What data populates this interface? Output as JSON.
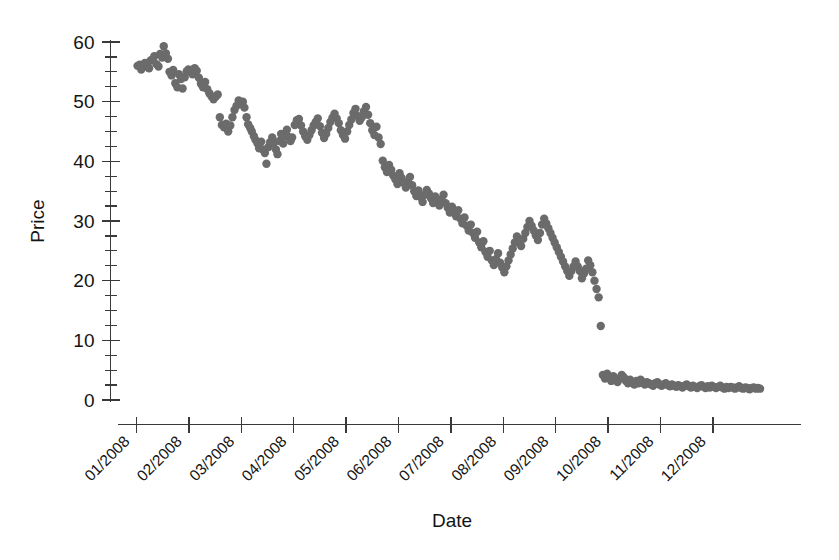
{
  "chart_data": {
    "type": "scatter",
    "title": "",
    "xlabel": "Date",
    "ylabel": "Price",
    "grid": false,
    "legend": null,
    "point_color": "#6b6b6b",
    "axis_color": "#3a3a3a",
    "background": "#ffffff",
    "ylim": [
      0,
      60
    ],
    "y_major_ticks": [
      0,
      10,
      20,
      30,
      40,
      50,
      60
    ],
    "y_major_labels": [
      "0",
      "10",
      "20",
      "30",
      "40",
      "50",
      "60"
    ],
    "y_minor_interval": 2.5,
    "xlim": [
      0,
      13
    ],
    "x_tick_labels": [
      "01/2008",
      "02/2008",
      "03/2008",
      "04/2008",
      "05/2008",
      "06/2008",
      "07/2008",
      "08/2008",
      "09/2008",
      "10/2008",
      "11/2008",
      "12/2008"
    ],
    "x_tick_positions": [
      1,
      2,
      3,
      4,
      5,
      6,
      7,
      8,
      9,
      10,
      11,
      12
    ],
    "x_tick_rotation_deg": -45,
    "x_unit": "month-index",
    "series": [
      {
        "name": "Price",
        "marker": "circle",
        "marker_radius_px": 4.2,
        "x": [
          1.02,
          1.06,
          1.09,
          1.13,
          1.16,
          1.2,
          1.24,
          1.27,
          1.31,
          1.34,
          1.38,
          1.42,
          1.45,
          1.49,
          1.52,
          1.56,
          1.6,
          1.63,
          1.67,
          1.7,
          1.74,
          1.78,
          1.81,
          1.85,
          1.88,
          1.92,
          1.96,
          1.99,
          2.03,
          2.07,
          2.11,
          2.15,
          2.19,
          2.23,
          2.27,
          2.31,
          2.35,
          2.39,
          2.43,
          2.47,
          2.51,
          2.55,
          2.59,
          2.63,
          2.67,
          2.71,
          2.75,
          2.79,
          2.83,
          2.87,
          2.91,
          2.95,
          2.99,
          3.03,
          3.06,
          3.1,
          3.13,
          3.17,
          3.2,
          3.24,
          3.27,
          3.31,
          3.34,
          3.38,
          3.41,
          3.45,
          3.48,
          3.52,
          3.55,
          3.59,
          3.62,
          3.66,
          3.69,
          3.73,
          3.76,
          3.8,
          3.83,
          3.87,
          3.9,
          3.94,
          3.97,
          4.02,
          4.06,
          4.1,
          4.14,
          4.18,
          4.22,
          4.26,
          4.3,
          4.34,
          4.38,
          4.42,
          4.46,
          4.5,
          4.54,
          4.58,
          4.62,
          4.66,
          4.7,
          4.74,
          4.78,
          4.82,
          4.86,
          4.9,
          4.94,
          4.98,
          5.02,
          5.06,
          5.1,
          5.14,
          5.18,
          5.22,
          5.26,
          5.3,
          5.34,
          5.38,
          5.42,
          5.46,
          5.5,
          5.54,
          5.58,
          5.62,
          5.66,
          5.7,
          5.74,
          5.78,
          5.82,
          5.86,
          5.9,
          5.94,
          5.98,
          6.02,
          6.06,
          6.1,
          6.14,
          6.18,
          6.22,
          6.26,
          6.3,
          6.34,
          6.38,
          6.42,
          6.46,
          6.5,
          6.54,
          6.58,
          6.62,
          6.66,
          6.7,
          6.74,
          6.78,
          6.82,
          6.86,
          6.9,
          6.94,
          6.98,
          7.02,
          7.06,
          7.1,
          7.14,
          7.18,
          7.22,
          7.26,
          7.3,
          7.34,
          7.38,
          7.42,
          7.46,
          7.5,
          7.54,
          7.58,
          7.62,
          7.66,
          7.7,
          7.74,
          7.78,
          7.82,
          7.86,
          7.9,
          7.94,
          7.98,
          8.02,
          8.06,
          8.1,
          8.14,
          8.18,
          8.22,
          8.26,
          8.3,
          8.34,
          8.38,
          8.42,
          8.46,
          8.5,
          8.54,
          8.58,
          8.62,
          8.66,
          8.7,
          8.74,
          8.78,
          8.82,
          8.86,
          8.9,
          8.94,
          8.98,
          9.02,
          9.06,
          9.1,
          9.14,
          9.18,
          9.22,
          9.26,
          9.3,
          9.34,
          9.38,
          9.42,
          9.46,
          9.5,
          9.54,
          9.58,
          9.62,
          9.66,
          9.7,
          9.74,
          9.78,
          9.82,
          9.86,
          9.9,
          9.94,
          9.98,
          10.02,
          10.06,
          10.1,
          10.14,
          10.18,
          10.22,
          10.26,
          10.3,
          10.34,
          10.38,
          10.42,
          10.46,
          10.5,
          10.54,
          10.58,
          10.62,
          10.66,
          10.7,
          10.74,
          10.78,
          10.82,
          10.86,
          10.9,
          10.94,
          10.98,
          11.02,
          11.06,
          11.1,
          11.14,
          11.18,
          11.22,
          11.26,
          11.3,
          11.34,
          11.38,
          11.42,
          11.46,
          11.5,
          11.54,
          11.58,
          11.62,
          11.66,
          11.7,
          11.74,
          11.78,
          11.82,
          11.86,
          11.9,
          11.94,
          11.98,
          12.02,
          12.06,
          12.1,
          12.14,
          12.18,
          12.22,
          12.26,
          12.3,
          12.34,
          12.38,
          12.42,
          12.46,
          12.5,
          12.54,
          12.58,
          12.62,
          12.66,
          12.7,
          12.74,
          12.78,
          12.82,
          12.86,
          12.9
        ],
        "y": [
          56.0,
          56.2,
          55.4,
          55.8,
          56.5,
          56.1,
          55.6,
          56.9,
          57.1,
          57.6,
          56.3,
          55.9,
          58.0,
          57.4,
          59.3,
          58.1,
          57.2,
          55.0,
          54.4,
          55.3,
          53.1,
          52.4,
          54.6,
          53.8,
          52.2,
          54.1,
          55.1,
          55.4,
          55.0,
          54.6,
          55.6,
          55.2,
          54.0,
          53.0,
          52.4,
          53.3,
          52.1,
          51.4,
          50.9,
          50.4,
          50.8,
          51.2,
          47.4,
          46.1,
          45.7,
          46.3,
          45.0,
          46.0,
          47.4,
          48.6,
          49.3,
          50.2,
          49.6,
          50.0,
          49.0,
          47.4,
          46.2,
          45.6,
          45.0,
          44.2,
          43.6,
          43.0,
          42.2,
          43.3,
          42.0,
          41.4,
          39.6,
          42.4,
          43.2,
          44.0,
          43.1,
          42.0,
          41.2,
          43.4,
          44.6,
          43.0,
          44.2,
          45.3,
          44.1,
          43.4,
          44.0,
          46.1,
          46.9,
          47.1,
          46.0,
          45.0,
          44.2,
          43.6,
          44.4,
          45.2,
          46.0,
          46.6,
          47.2,
          45.9,
          44.8,
          43.9,
          44.6,
          45.6,
          46.6,
          47.3,
          48.0,
          47.2,
          46.4,
          45.2,
          44.4,
          43.8,
          45.0,
          46.1,
          47.0,
          48.1,
          48.8,
          47.6,
          46.8,
          47.4,
          48.4,
          49.1,
          47.8,
          46.4,
          45.2,
          44.4,
          45.8,
          44.0,
          42.9,
          40.1,
          39.0,
          38.2,
          39.4,
          38.6,
          37.6,
          37.0,
          36.2,
          38.0,
          37.2,
          36.4,
          35.6,
          36.6,
          37.4,
          36.0,
          35.0,
          34.2,
          35.1,
          34.0,
          33.2,
          34.4,
          35.2,
          34.6,
          33.8,
          33.0,
          34.1,
          33.4,
          32.6,
          33.6,
          34.4,
          33.0,
          32.2,
          31.4,
          32.4,
          31.6,
          30.8,
          31.8,
          30.4,
          29.6,
          30.6,
          29.2,
          28.4,
          29.4,
          28.0,
          27.2,
          28.2,
          26.4,
          25.6,
          26.6,
          24.8,
          24.0,
          25.0,
          23.4,
          22.6,
          23.6,
          24.6,
          23.0,
          22.2,
          21.4,
          22.4,
          23.4,
          24.4,
          25.4,
          26.4,
          27.4,
          26.6,
          25.8,
          27.0,
          28.0,
          29.0,
          30.0,
          29.2,
          28.4,
          27.6,
          26.8,
          28.0,
          29.4,
          30.4,
          29.6,
          28.8,
          28.0,
          27.2,
          26.4,
          25.6,
          24.8,
          24.0,
          23.2,
          22.4,
          21.6,
          20.8,
          21.6,
          22.4,
          23.2,
          22.4,
          21.6,
          20.4,
          21.2,
          22.0,
          23.4,
          22.6,
          21.4,
          20.0,
          18.6,
          17.2,
          12.4,
          4.2,
          3.6,
          4.4,
          3.8,
          3.2,
          4.0,
          3.4,
          3.0,
          3.6,
          4.2,
          3.8,
          3.2,
          2.8,
          3.4,
          3.0,
          2.6,
          3.2,
          2.8,
          3.4,
          3.0,
          2.6,
          3.0,
          2.8,
          2.6,
          2.4,
          2.8,
          3.0,
          2.6,
          2.4,
          2.6,
          2.8,
          2.5,
          2.3,
          2.6,
          2.4,
          2.2,
          2.5,
          2.3,
          2.1,
          2.4,
          2.6,
          2.3,
          2.1,
          2.4,
          2.2,
          2.0,
          2.3,
          2.5,
          2.2,
          2.0,
          2.3,
          2.1,
          2.4,
          2.2,
          2.0,
          2.2,
          2.4,
          2.1,
          1.9,
          2.2,
          2.0,
          2.2,
          2.1,
          1.9,
          2.1,
          2.3,
          2.0,
          1.9,
          2.1,
          2.0,
          1.8,
          2.0,
          2.1,
          1.9,
          2.0,
          1.9
        ]
      }
    ]
  }
}
